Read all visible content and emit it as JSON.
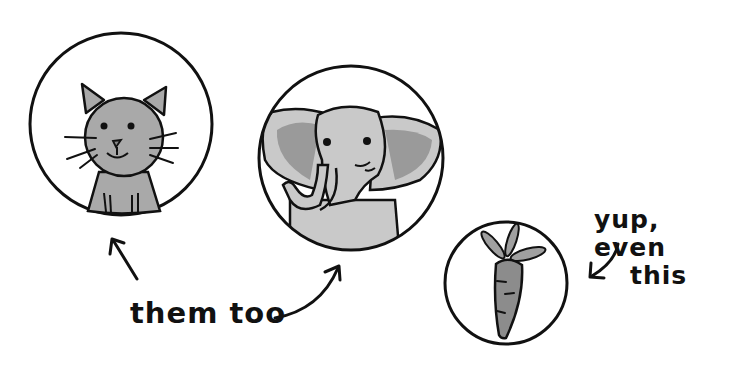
{
  "captions": {
    "them_too": "them too",
    "yup_line1": "yup, even",
    "yup_line2": "this"
  },
  "figures": [
    {
      "name": "cat",
      "label": "cat in circle"
    },
    {
      "name": "elephant",
      "label": "elephant in circle"
    },
    {
      "name": "carrot",
      "label": "carrot in circle"
    }
  ],
  "colors": {
    "ink": "#111111",
    "gray_light": "#c9c9c9",
    "gray_mid": "#aaaaaa",
    "gray_dark": "#8c8c8c",
    "background": "#ffffff"
  }
}
